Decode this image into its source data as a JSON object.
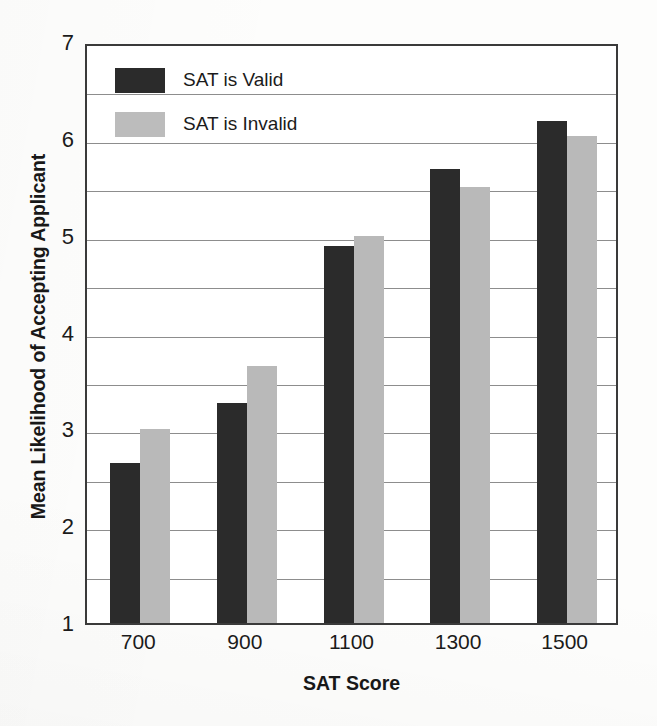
{
  "chart_data": {
    "type": "bar",
    "title": "",
    "subtitle": "",
    "xlabel": "SAT Score",
    "ylabel": "Mean Likelihood of Accepting Applicant",
    "categories": [
      "700",
      "900",
      "1100",
      "1300",
      "1500"
    ],
    "series": [
      {
        "name": "SAT is Valid",
        "values": [
          2.65,
          3.27,
          4.89,
          5.69,
          6.18
        ],
        "color": "#2b2b2b"
      },
      {
        "name": "SAT is Invalid",
        "values": [
          3.0,
          3.65,
          5.0,
          5.5,
          6.03
        ],
        "color": "#b9b9b9"
      }
    ],
    "ylim": [
      1,
      7
    ],
    "ytick_labels": [
      "7",
      "6",
      "5",
      "4",
      "3",
      "2",
      "1"
    ],
    "ytick_values": [
      7,
      6,
      5,
      4,
      3,
      2,
      1
    ],
    "gridline_values": [
      6.5,
      6.0,
      5.5,
      5.0,
      4.5,
      4.0,
      3.5,
      3.0,
      2.5,
      2.0,
      1.5
    ],
    "grid": true,
    "legend_position": "top-left",
    "legend": [
      "SAT is Valid",
      "SAT is Invalid"
    ]
  },
  "axis": {
    "y_title": "Mean Likelihood of Accepting Applicant",
    "x_title": "SAT Score"
  },
  "legend": {
    "items": [
      {
        "label": "SAT is Valid",
        "swatch": "legend-swatch-valid"
      },
      {
        "label": "SAT is Invalid",
        "swatch": "legend-swatch-invalid"
      }
    ]
  },
  "colors": {
    "valid": "#2b2b2b",
    "invalid": "#b9b9b9",
    "axis": "#3a3a3a",
    "grid": "#8d8d8d",
    "text": "#1b1b1b",
    "background": "#ffffff"
  }
}
